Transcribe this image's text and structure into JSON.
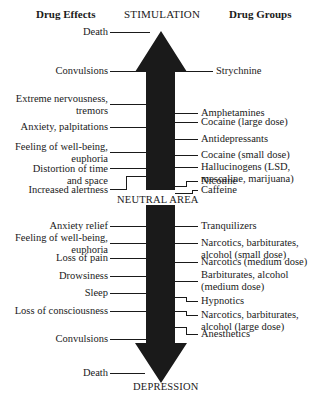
{
  "header": {
    "left_title": "Drug Effects",
    "center_title": "STIMULATION",
    "right_title": "Drug Groups"
  },
  "axis": {
    "top_label": "STIMULATION",
    "middle_label": "NEUTRAL AREA",
    "bottom_label": "DEPRESSION",
    "arrow_color": "#1a1a1a"
  },
  "stimulant_effects": [
    {
      "text": "Death"
    },
    {
      "text": "Convulsions"
    },
    {
      "text": "Extreme nervousness,\ntremors"
    },
    {
      "text": "Anxiety, palpitations"
    },
    {
      "text": "Feeling of well-being,\neuphoria"
    },
    {
      "text": "Distortion of time\nand space"
    },
    {
      "text": "Increased alertness"
    }
  ],
  "stimulant_groups": [
    {
      "text": "Strychnine"
    },
    {
      "text": "Amphetamines"
    },
    {
      "text": "Cocaine (large dose)"
    },
    {
      "text": "Antidepressants"
    },
    {
      "text": "Cocaine (small dose)"
    },
    {
      "text": "Hallucinogens (LSD,\nmescaline, marijuana)"
    },
    {
      "text": "Nicotine"
    },
    {
      "text": "Caffeine"
    }
  ],
  "depressant_effects": [
    {
      "text": "Anxiety relief"
    },
    {
      "text": "Feeling of well-being,\neuphoria"
    },
    {
      "text": "Loss of pain"
    },
    {
      "text": "Drowsiness"
    },
    {
      "text": "Sleep"
    },
    {
      "text": "Loss of consciousness"
    },
    {
      "text": "Convulsions"
    },
    {
      "text": "Death"
    }
  ],
  "depressant_groups": [
    {
      "text": "Tranquilizers"
    },
    {
      "text": "Narcotics, barbiturates,\nalcohol (small dose)"
    },
    {
      "text": "Narcotics (medium dose)"
    },
    {
      "text": "Barbiturates, alcohol\n(medium dose)"
    },
    {
      "text": "Hypnotics"
    },
    {
      "text": "Narcotics, barbiturates,\nalcohol (large dose)"
    },
    {
      "text": "Anesthetics"
    }
  ]
}
